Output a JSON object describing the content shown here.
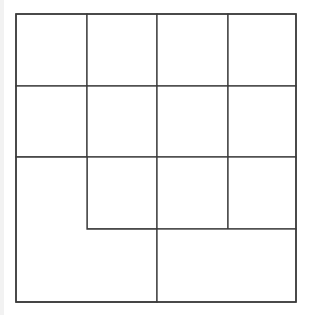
{
  "diagram": {
    "title": "",
    "stroke_color": "#3a3a3a",
    "background_color": "#ffffff",
    "outer_box": {
      "x": 16,
      "y": 14,
      "width": 280,
      "height": 288
    },
    "columns_x": [
      16,
      87,
      157,
      228,
      296
    ],
    "rows_y": [
      14,
      86,
      157,
      229,
      302
    ],
    "cells": [
      {
        "id": "r1c1",
        "x": 16,
        "y": 14,
        "w": 71,
        "h": 72
      },
      {
        "id": "r1c2",
        "x": 87,
        "y": 14,
        "w": 70,
        "h": 72
      },
      {
        "id": "r1c3",
        "x": 157,
        "y": 14,
        "w": 71,
        "h": 72
      },
      {
        "id": "r1c4",
        "x": 228,
        "y": 14,
        "w": 68,
        "h": 72
      },
      {
        "id": "r2c1",
        "x": 16,
        "y": 86,
        "w": 71,
        "h": 71
      },
      {
        "id": "r2c2",
        "x": 87,
        "y": 86,
        "w": 70,
        "h": 71
      },
      {
        "id": "r2c3",
        "x": 157,
        "y": 86,
        "w": 71,
        "h": 71
      },
      {
        "id": "r2c4",
        "x": 228,
        "y": 86,
        "w": 68,
        "h": 71
      },
      {
        "id": "r3c2",
        "x": 87,
        "y": 157,
        "w": 70,
        "h": 72
      },
      {
        "id": "r3c3",
        "x": 157,
        "y": 157,
        "w": 71,
        "h": 72
      },
      {
        "id": "r3c4",
        "x": 228,
        "y": 157,
        "w": 68,
        "h": 72
      }
    ],
    "merged_regions": [
      {
        "id": "l-shape-bottom-left",
        "points": "16,157 87,157 87,229 157,229 157,302 16,302"
      },
      {
        "id": "rect-bottom-right",
        "x": 157,
        "y": 229,
        "w": 139,
        "h": 73
      }
    ]
  }
}
